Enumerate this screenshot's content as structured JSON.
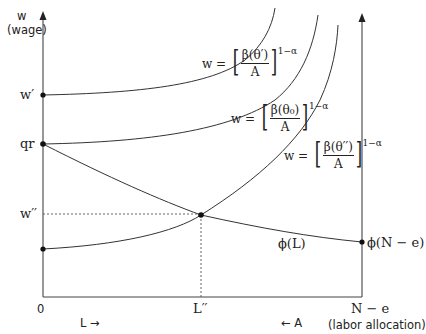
{
  "diagram": {
    "y_axis": {
      "symbol": "w",
      "label": "(wage)"
    },
    "x_axis": {
      "origin_label": "0",
      "right_end_label": "N − e",
      "right_end_caption": "(labor allocation)",
      "left_direction": "L →",
      "right_direction": "← A"
    },
    "y_ticks": [
      {
        "label": "w′"
      },
      {
        "label": "qr"
      },
      {
        "label": "w′′"
      }
    ],
    "x_ticks": [
      {
        "label": "L′′"
      }
    ],
    "curves": [
      {
        "name": "wage-curve-theta-prime",
        "lhs": "w =",
        "numerator": "β(θ′)",
        "denominator": "A",
        "exponent": "1−α"
      },
      {
        "name": "wage-curve-theta-zero",
        "lhs": "w =",
        "numerator": "β(θ₀)",
        "denominator": "A",
        "exponent": "1−α"
      },
      {
        "name": "wage-curve-theta-double-prime",
        "lhs": "w =",
        "numerator": "β(θ′′)",
        "denominator": "A",
        "exponent": "1−α"
      }
    ],
    "phi_curve": {
      "label": "ϕ(L)",
      "end_label": "ϕ(N − e)"
    }
  }
}
